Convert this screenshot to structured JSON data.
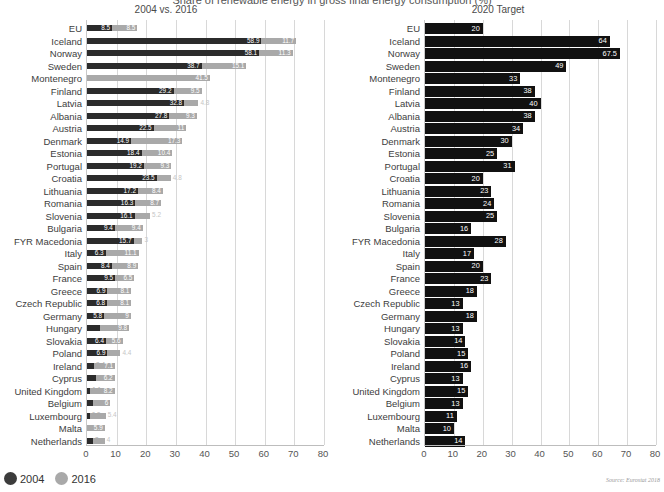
{
  "header": {
    "main_title": "Share of renewable energy in gross final energy consumption (%)",
    "left_panel_title": "2004 vs. 2016",
    "right_panel_title": "2020 Target"
  },
  "legend": {
    "items": [
      {
        "label": "2004",
        "color": "#3c3c3c",
        "marker": "dot"
      },
      {
        "label": "2016",
        "color": "#a9a9a9",
        "marker": "dot"
      }
    ]
  },
  "source": "Source: Eurostat 2018",
  "axis": {
    "ticks": [
      0,
      10,
      20,
      30,
      40,
      50,
      60,
      70,
      80
    ],
    "min": 0,
    "max": 80
  },
  "chart_data": {
    "type": "bar",
    "title": "Share of renewable energy in gross final energy consumption (%)",
    "orientation": "horizontal",
    "grid": true,
    "legend_position": "bottom-left",
    "xlabel": "",
    "ylabel": "",
    "xlim": [
      0,
      80
    ],
    "panels": [
      {
        "name": "left",
        "title": "2004 vs. 2016",
        "series": [
          {
            "name": "2004",
            "color": "#2b2b2b"
          },
          {
            "name": "2016",
            "color": "#a9a9a9"
          }
        ],
        "categories": [
          "EU",
          "Iceland",
          "Norway",
          "Sweden",
          "Montenegro",
          "Finland",
          "Latvia",
          "Albania",
          "Austria",
          "Denmark",
          "Estonia",
          "Portugal",
          "Croatia",
          "Lithuania",
          "Romania",
          "Slovenia",
          "Bulgaria",
          "FYR Macedonia",
          "Italy",
          "Spain",
          "France",
          "Greece",
          "Czech Republic",
          "Germany",
          "Hungary",
          "Slovakia",
          "Poland",
          "Ireland",
          "Cyprus",
          "United Kingdom",
          "Belgium",
          "Luxembourg",
          "Malta",
          "Netherlands"
        ],
        "values_2004": [
          8.5,
          58.9,
          58.1,
          38.7,
          0,
          29.2,
          32.8,
          27.8,
          22.5,
          14.9,
          18.4,
          19.2,
          23.5,
          17.2,
          16.3,
          16.1,
          9.4,
          15.7,
          6.3,
          8.4,
          9.5,
          6.9,
          6.8,
          5.8,
          4.4,
          6.4,
          6.9,
          2.4,
          3.1,
          1.1,
          1.9,
          0.9,
          0.1,
          2.0
        ],
        "values_2016": [
          8.5,
          11.7,
          11.3,
          15.1,
          41.5,
          9.5,
          4.8,
          9.3,
          11.0,
          17.3,
          10.4,
          9.3,
          4.8,
          8.4,
          8.7,
          5.2,
          9.4,
          3.0,
          11.1,
          8.9,
          6.5,
          8.1,
          8.1,
          9.0,
          9.8,
          5.6,
          4.4,
          7.1,
          6.2,
          8.2,
          6.0,
          5.4,
          5.9,
          4.0
        ]
      },
      {
        "name": "right",
        "title": "2020 Target",
        "series": [
          {
            "name": "2020 Target",
            "color": "#111111"
          }
        ],
        "categories": [
          "EU",
          "Iceland",
          "Norway",
          "Sweden",
          "Montenegro",
          "Finland",
          "Latvia",
          "Albania",
          "Austria",
          "Denmark",
          "Estonia",
          "Portugal",
          "Croatia",
          "Lithuania",
          "Romania",
          "Slovenia",
          "Bulgaria",
          "FYR Macedonia",
          "Italy",
          "Spain",
          "France",
          "Greece",
          "Czech Republic",
          "Germany",
          "Hungary",
          "Slovakia",
          "Poland",
          "Ireland",
          "Cyprus",
          "United Kingdom",
          "Belgium",
          "Luxembourg",
          "Malta",
          "Netherlands"
        ],
        "values": [
          20,
          64,
          67.5,
          49,
          33,
          38,
          40,
          38,
          34,
          30,
          25,
          31,
          20,
          23,
          24,
          25,
          16,
          28,
          17,
          20,
          23,
          18,
          13,
          18,
          13,
          14,
          15,
          16,
          13,
          15,
          13,
          11,
          10,
          14
        ]
      }
    ]
  }
}
